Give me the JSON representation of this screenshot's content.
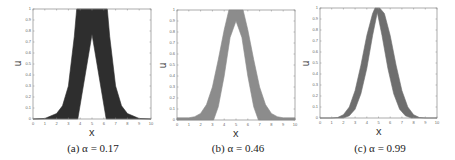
{
  "chart_data": [
    {
      "type": "area",
      "title": "(a) α = 0.17",
      "caption": "(a) α = 0.17",
      "xlabel": "x",
      "ylabel": "u",
      "xlim": [
        0,
        10
      ],
      "ylim": [
        0,
        1
      ],
      "xticks": [
        "0",
        "1",
        "2",
        "3",
        "4",
        "5",
        "6",
        "7",
        "8",
        "9",
        "10"
      ],
      "yticks": [
        "0",
        "0.1",
        "0.2",
        "0.3",
        "0.4",
        "0.5",
        "0.6",
        "0.7",
        "0.8",
        "0.9",
        "1"
      ],
      "fill_color": "#2e2e2e",
      "band": {
        "upper": {
          "x": [
            0,
            1,
            2,
            2.5,
            3,
            3.5,
            3.7,
            6.3,
            6.5,
            7,
            7.5,
            8,
            9,
            10
          ],
          "y": [
            0,
            0.005,
            0.05,
            0.12,
            0.3,
            0.75,
            1,
            1,
            0.75,
            0.3,
            0.12,
            0.05,
            0.005,
            0
          ]
        },
        "lower": {
          "x": [
            0,
            3.8,
            5,
            6.2,
            10
          ],
          "y": [
            0,
            0,
            0.77,
            0,
            0
          ]
        }
      }
    },
    {
      "type": "area",
      "title": "(b) α = 0.46",
      "caption": "(b) α = 0.46",
      "xlabel": "x",
      "ylabel": "u",
      "xlim": [
        0,
        10
      ],
      "ylim": [
        0,
        1
      ],
      "xticks": [
        "0",
        "1",
        "2",
        "3",
        "4",
        "5",
        "6",
        "7",
        "8",
        "9",
        "10"
      ],
      "yticks": [
        "0",
        "0.1",
        "0.2",
        "0.3",
        "0.4",
        "0.5",
        "0.6",
        "0.7",
        "0.8",
        "0.9",
        "1"
      ],
      "fill_color": "#8c8c8c",
      "band": {
        "upper": {
          "x": [
            0,
            1,
            1.5,
            2,
            2.5,
            3,
            3.5,
            4,
            4.4,
            5.6,
            6,
            6.5,
            7,
            7.5,
            8,
            8.5,
            9,
            10
          ],
          "y": [
            0.02,
            0.02,
            0.03,
            0.06,
            0.14,
            0.3,
            0.55,
            0.82,
            1,
            1,
            0.82,
            0.55,
            0.3,
            0.14,
            0.06,
            0.03,
            0.02,
            0.02
          ]
        },
        "lower": {
          "x": [
            0,
            3.1,
            3.5,
            4,
            4.5,
            5,
            5.5,
            6,
            6.5,
            6.9,
            10
          ],
          "y": [
            0,
            0,
            0.12,
            0.4,
            0.75,
            0.9,
            0.75,
            0.4,
            0.12,
            0,
            0
          ]
        }
      }
    },
    {
      "type": "area",
      "title": "(c) α = 0.99",
      "caption": "(c) α = 0.99",
      "xlabel": "x",
      "ylabel": "u",
      "xlim": [
        0,
        10
      ],
      "ylim": [
        0,
        1
      ],
      "xticks": [
        "0",
        "1",
        "2",
        "3",
        "4",
        "5",
        "6",
        "7",
        "8",
        "9",
        "10"
      ],
      "yticks": [
        "0",
        "0.1",
        "0.2",
        "0.3",
        "0.4",
        "0.5",
        "0.6",
        "0.7",
        "0.8",
        "0.9",
        "1"
      ],
      "fill_color": "#6e6e6e",
      "band": {
        "upper": {
          "x": [
            0,
            1,
            1.5,
            2,
            2.5,
            3,
            3.5,
            4,
            4.5,
            4.7,
            5.1,
            5.5,
            6,
            6.5,
            7,
            7.5,
            8,
            8.5,
            9,
            10
          ],
          "y": [
            0,
            0,
            0.005,
            0.03,
            0.1,
            0.25,
            0.48,
            0.75,
            0.95,
            1,
            1,
            0.95,
            0.75,
            0.48,
            0.25,
            0.1,
            0.03,
            0.005,
            0,
            0
          ]
        },
        "lower": {
          "x": [
            0,
            2,
            2.5,
            3,
            3.5,
            4,
            4.5,
            4.9,
            5.3,
            5.8,
            6.3,
            6.8,
            7.3,
            7.8,
            8.3,
            10
          ],
          "y": [
            0,
            0,
            0.02,
            0.08,
            0.22,
            0.45,
            0.75,
            0.96,
            0.75,
            0.45,
            0.22,
            0.08,
            0.02,
            0.0,
            0,
            0
          ]
        }
      }
    }
  ],
  "panels": [
    {
      "caption": "(a) α = 0.17",
      "xlabel": "x",
      "ylabel": "u"
    },
    {
      "caption": "(b) α = 0.46",
      "xlabel": "x",
      "ylabel": "u"
    },
    {
      "caption": "(c) α = 0.99",
      "xlabel": "x",
      "ylabel": "u"
    }
  ]
}
